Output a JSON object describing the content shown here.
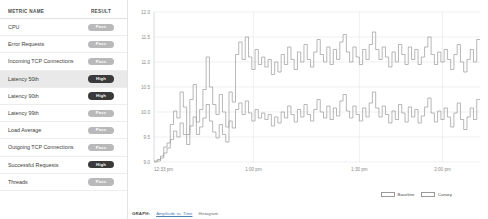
{
  "table": {
    "columns": [
      "METRIC NAME",
      "RESULT"
    ],
    "rows": [
      {
        "name": "CPU",
        "result": "Pass",
        "state": "pass",
        "selected": false
      },
      {
        "name": "Error Requests",
        "result": "Pass",
        "state": "pass",
        "selected": false
      },
      {
        "name": "Incoming TCP Connections",
        "result": "Pass",
        "state": "pass",
        "selected": false
      },
      {
        "name": "Latency 50th",
        "result": "High",
        "state": "high",
        "selected": true
      },
      {
        "name": "Latency 90th",
        "result": "High",
        "state": "high",
        "selected": false
      },
      {
        "name": "Latency 99th",
        "result": "Pass",
        "state": "pass",
        "selected": false
      },
      {
        "name": "Load Average",
        "result": "Pass",
        "state": "pass",
        "selected": false
      },
      {
        "name": "Outgoing TCP Connections",
        "result": "Pass",
        "state": "pass",
        "selected": false
      },
      {
        "name": "Successful Requests",
        "result": "High",
        "state": "high",
        "selected": false
      },
      {
        "name": "Threads",
        "result": "Pass",
        "state": "pass",
        "selected": false
      }
    ]
  },
  "footer": {
    "graph_label": "GRAPH:",
    "link_amplitude": "Amplitude vs. Time",
    "option_histogram": "Histogram"
  },
  "colors": {
    "pass_badge": "#b9b9b9",
    "high_badge": "#3a3a3a",
    "baseline_line": "#9a9a9a",
    "canary_line": "#9a9a9a",
    "grid": "#e6e6e6",
    "selected_row": "#e9e9e9"
  },
  "chart_data": {
    "type": "line",
    "title": "",
    "xlabel": "",
    "ylabel": "",
    "ylim": [
      9.0,
      12.0
    ],
    "yticks": [
      12.0,
      11.5,
      11.0,
      10.5,
      10.0,
      9.5,
      9.0
    ],
    "ytick_labels": [
      "12.0",
      "11.5",
      "11.0",
      "10.5",
      "10.0",
      "9.5",
      "9.0"
    ],
    "xticks": [
      "12:33 pm",
      "1:00 pm",
      "1:30 pm",
      "2:00 pm"
    ],
    "xtick_positions": [
      0,
      0.305,
      0.63,
      0.885
    ],
    "grid": true,
    "legend_position": "bottom-right",
    "step": true,
    "legend": [
      "Baseline",
      "Canary"
    ],
    "series": [
      {
        "name": "Baseline",
        "values": [
          9.02,
          9.05,
          9.12,
          9.3,
          9.38,
          9.75,
          10.02,
          9.88,
          10.4,
          10.1,
          9.55,
          10.25,
          10.55,
          9.8,
          10.05,
          10.45,
          11.1,
          10.5,
          10.15,
          9.95,
          10.35,
          10.0,
          9.7,
          10.4,
          10.2,
          11.15,
          11.4,
          11.05,
          11.5,
          11.1,
          10.85,
          11.25,
          10.95,
          11.1,
          10.9,
          11.05,
          10.75,
          11.0,
          10.8,
          11.15,
          10.95,
          11.3,
          11.05,
          10.85,
          11.2,
          11.0,
          11.35,
          11.05,
          10.9,
          11.2,
          11.45,
          11.15,
          11.0,
          11.3,
          10.95,
          11.25,
          11.05,
          11.4,
          11.55,
          11.2,
          11.0,
          11.3,
          11.1,
          10.95,
          11.25,
          11.05,
          11.35,
          11.6,
          11.25,
          11.05,
          11.3,
          11.1,
          10.9,
          11.2,
          11.0,
          11.35,
          11.15,
          10.95,
          11.3,
          11.05,
          11.25,
          10.95,
          11.1,
          11.3,
          11.5,
          11.15,
          10.95,
          11.2,
          11.0,
          11.25,
          11.05,
          10.85,
          11.15,
          11.35,
          11.0,
          10.8,
          11.05,
          11.25,
          11.0,
          11.45
        ]
      },
      {
        "name": "Canary",
        "values": [
          9.0,
          9.02,
          9.08,
          9.18,
          9.28,
          9.45,
          9.62,
          9.5,
          9.78,
          9.55,
          9.35,
          9.72,
          9.9,
          9.55,
          9.7,
          9.88,
          10.15,
          9.82,
          9.6,
          9.48,
          9.75,
          9.55,
          9.4,
          9.82,
          9.68,
          10.05,
          10.18,
          9.95,
          10.22,
          9.98,
          9.82,
          10.05,
          9.88,
          9.98,
          9.85,
          9.95,
          9.72,
          9.9,
          9.78,
          10.0,
          9.88,
          10.12,
          9.95,
          9.8,
          10.05,
          9.9,
          10.15,
          9.95,
          9.82,
          10.05,
          10.25,
          10.0,
          9.88,
          10.12,
          9.85,
          10.08,
          9.92,
          10.22,
          10.35,
          10.02,
          9.88,
          10.12,
          9.95,
          9.82,
          10.08,
          9.9,
          10.18,
          10.4,
          10.08,
          9.9,
          10.12,
          9.95,
          9.78,
          10.02,
          9.85,
          10.15,
          9.98,
          9.8,
          10.1,
          9.9,
          10.05,
          9.78,
          9.92,
          10.1,
          10.28,
          9.98,
          9.8,
          10.02,
          9.85,
          10.08,
          9.9,
          9.7,
          9.98,
          10.18,
          9.85,
          9.65,
          9.9,
          10.08,
          9.85,
          10.25
        ]
      }
    ]
  }
}
